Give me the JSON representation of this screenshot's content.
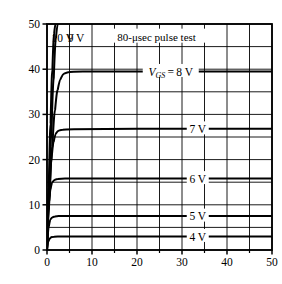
{
  "chart_data": {
    "type": "line",
    "title": "",
    "annotation": "80-μsec pulse test",
    "xlabel": "",
    "ylabel_parts": {
      "symbol": "I",
      "subscript": "D",
      "text": "—Drain current (amperes)"
    },
    "ylabel": "ID—Drain current (amperes)",
    "xlim": [
      0,
      50
    ],
    "ylim": [
      0,
      50
    ],
    "xticks": [
      0,
      10,
      20,
      30,
      40,
      50
    ],
    "yticks": [
      0,
      10,
      20,
      30,
      40,
      50
    ],
    "xticklabels": [
      "0",
      "10",
      "20",
      "30",
      "40",
      "50"
    ],
    "yticklabels": [
      "0",
      "10",
      "20",
      "30",
      "40",
      "50"
    ],
    "grid": true,
    "grid_step_x": 5,
    "grid_step_y": 5,
    "minor_ticks_x": 5,
    "legend_position": "inline-curve-labels",
    "curve_label_prefix": "V",
    "curve_label_subscript": "GS",
    "series": [
      {
        "name": "10 V",
        "label": "10 V",
        "label_x": 1.0,
        "label_y": 47.0,
        "label_inline": false,
        "saturation": 50,
        "knee_x": 3.6,
        "points": [
          [
            0,
            0
          ],
          [
            0.4,
            14
          ],
          [
            0.8,
            28
          ],
          [
            1.2,
            40
          ],
          [
            1.6,
            48
          ],
          [
            1.9,
            50
          ]
        ]
      },
      {
        "name": "9 V",
        "label": "9 V",
        "label_x": 4.6,
        "label_y": 47.0,
        "label_inline": false,
        "saturation": 50,
        "knee_x": 3.2,
        "points": [
          [
            0,
            0
          ],
          [
            0.5,
            13
          ],
          [
            1.0,
            26
          ],
          [
            1.5,
            38
          ],
          [
            2.0,
            47
          ],
          [
            2.4,
            50
          ]
        ]
      },
      {
        "name": "8 V",
        "label": "8 V",
        "label_x": 27.5,
        "label_y": 39.5,
        "label_inline": true,
        "label_has_vgs_prefix": true,
        "saturation": 39.5,
        "knee_x": 5.0,
        "points": [
          [
            0,
            0
          ],
          [
            0.6,
            12
          ],
          [
            1.2,
            23
          ],
          [
            1.8,
            31
          ],
          [
            2.4,
            35.5
          ],
          [
            3.0,
            37.8
          ],
          [
            3.8,
            39.0
          ],
          [
            5.0,
            39.4
          ],
          [
            8,
            39.5
          ],
          [
            20,
            39.5
          ],
          [
            35,
            39.5
          ],
          [
            50,
            39.5
          ]
        ]
      },
      {
        "name": "7 V",
        "label": "7 V",
        "label_x": 33.5,
        "label_y": 26.8,
        "label_inline": true,
        "saturation": 26.8,
        "knee_x": 3.6,
        "points": [
          [
            0,
            0
          ],
          [
            0.5,
            11
          ],
          [
            1.0,
            20
          ],
          [
            1.5,
            24
          ],
          [
            2.0,
            25.8
          ],
          [
            2.6,
            26.4
          ],
          [
            3.5,
            26.6
          ],
          [
            6,
            26.7
          ],
          [
            20,
            26.8
          ],
          [
            35,
            26.8
          ],
          [
            50,
            26.8
          ]
        ]
      },
      {
        "name": "6 V",
        "label": "6 V",
        "label_x": 33.5,
        "label_y": 15.8,
        "label_inline": true,
        "saturation": 15.8,
        "knee_x": 2.6,
        "points": [
          [
            0,
            0
          ],
          [
            0.4,
            9
          ],
          [
            0.8,
            13.5
          ],
          [
            1.2,
            15.0
          ],
          [
            1.7,
            15.5
          ],
          [
            2.4,
            15.7
          ],
          [
            4,
            15.8
          ],
          [
            20,
            15.8
          ],
          [
            35,
            15.8
          ],
          [
            50,
            15.8
          ]
        ]
      },
      {
        "name": "5 V",
        "label": "5 V",
        "label_x": 33.5,
        "label_y": 7.5,
        "label_inline": true,
        "saturation": 7.5,
        "knee_x": 2.2,
        "points": [
          [
            0,
            0
          ],
          [
            0.4,
            5.2
          ],
          [
            0.8,
            6.8
          ],
          [
            1.2,
            7.2
          ],
          [
            1.8,
            7.4
          ],
          [
            2.6,
            7.5
          ],
          [
            6,
            7.5
          ],
          [
            20,
            7.5
          ],
          [
            35,
            7.5
          ],
          [
            50,
            7.5
          ]
        ]
      },
      {
        "name": "4 V",
        "label": "4 V",
        "label_x": 33.5,
        "label_y": 3.0,
        "label_inline": true,
        "saturation": 3.0,
        "knee_x": 1.8,
        "points": [
          [
            0,
            0
          ],
          [
            0.3,
            1.9
          ],
          [
            0.7,
            2.6
          ],
          [
            1.1,
            2.85
          ],
          [
            1.6,
            2.95
          ],
          [
            2.4,
            3.0
          ],
          [
            6,
            3.0
          ],
          [
            20,
            3.0
          ],
          [
            35,
            3.0
          ],
          [
            50,
            3.0
          ]
        ]
      }
    ],
    "colors": {
      "curve": "#000000",
      "grid": "#000000",
      "axis": "#000000",
      "background": "#ffffff",
      "text": "#000000"
    }
  }
}
